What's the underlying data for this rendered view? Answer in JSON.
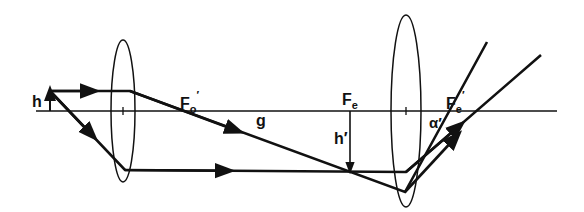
{
  "diagram": {
    "labels": {
      "object_height": "h",
      "objective_focus": "F",
      "objective_focus_sub": "o",
      "objective_focus_prime": "′",
      "distance": "g",
      "eyepiece_focus": "F",
      "eyepiece_focus_sub": "e",
      "image_height": "h′",
      "eyepiece_focus2": "F",
      "eyepiece_focus2_sub": "e",
      "eyepiece_focus2_prime": "′",
      "angle": "α′"
    },
    "elements": [
      "optical axis",
      "objective lens",
      "eyepiece lens",
      "object arrow h",
      "intermediate image arrow h′",
      "rays"
    ],
    "colors": {
      "line": "#111111",
      "background": "#ffffff"
    }
  }
}
